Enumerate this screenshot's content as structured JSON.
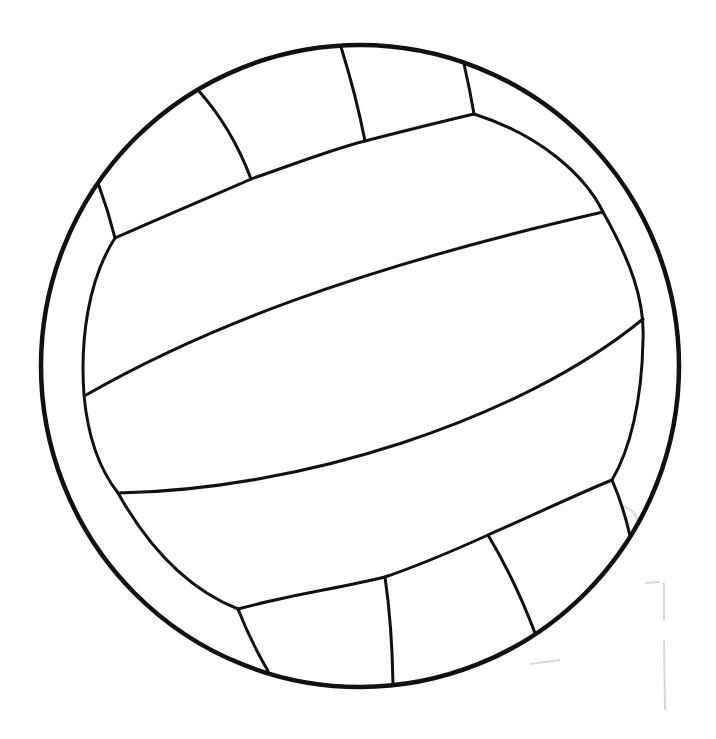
{
  "image": {
    "subject": "volleyball line drawing",
    "description": "Black outline drawing of a volleyball with curved panel seams on white background",
    "colors": {
      "background": "#ffffff",
      "stroke": "#111111",
      "smudge": "#bdbdbd"
    }
  },
  "ball": {
    "outer_circle": {
      "cx": 360,
      "cy": 366,
      "rx": 320,
      "ry": 322,
      "stroke_width": 4.5
    },
    "panels": {
      "top_band_count": 4,
      "middle_band_count": 3,
      "bottom_band_count": 4,
      "side_rings": 2
    }
  }
}
